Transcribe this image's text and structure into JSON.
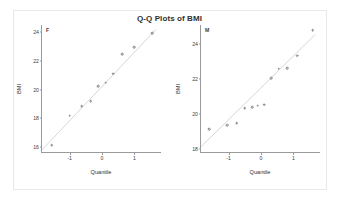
{
  "figure": {
    "title": "Q-Q Plots of BMI",
    "background": "#ffffff",
    "frame_color": "#e8e8e8",
    "axis_color": "#9a9a9a",
    "marker_color": "#7b7b7b",
    "refline_color": "#c4c4c4"
  },
  "chart_data": [
    {
      "type": "scatter",
      "title": "Q-Q Plots of BMI",
      "panel": "F",
      "xlabel": "Quantile",
      "ylabel": "BMI",
      "xlim": [
        -1.85,
        1.85
      ],
      "ylim": [
        15.6,
        24.5
      ],
      "xticks": [
        -1,
        0,
        1
      ],
      "xtick_labels": [
        "-1",
        "0",
        "1"
      ],
      "yticks": [
        16,
        18,
        20,
        22,
        24
      ],
      "ytick_labels": [
        "16",
        "18",
        "20",
        "22",
        "24"
      ],
      "grid": false,
      "legend": "none",
      "reference_line": {
        "x": [
          -1.85,
          1.7
        ],
        "y": [
          15.75,
          24.2
        ]
      },
      "x": [
        -1.55,
        -1.0,
        -0.62,
        -0.35,
        -0.12,
        0.12,
        0.35,
        0.62,
        1.0,
        1.55
      ],
      "y": [
        16.15,
        18.2,
        18.85,
        19.2,
        20.25,
        20.5,
        21.1,
        22.45,
        22.95,
        23.95
      ],
      "n_points": 10
    },
    {
      "type": "scatter",
      "title": "Q-Q Plots of BMI",
      "panel": "M",
      "xlabel": "Quantile",
      "ylabel": "BMI",
      "xlim": [
        -1.85,
        1.85
      ],
      "ylim": [
        17.8,
        25.1
      ],
      "xticks": [
        -1,
        0,
        1
      ],
      "xtick_labels": [
        "-1",
        "0",
        "1"
      ],
      "yticks": [
        18,
        20,
        22,
        24
      ],
      "ytick_labels": [
        "18",
        "20",
        "22",
        "24"
      ],
      "grid": false,
      "legend": "none",
      "reference_line": {
        "x": [
          -1.85,
          1.7
        ],
        "y": [
          18.1,
          24.55
        ]
      },
      "x": [
        -1.6,
        -1.05,
        -0.75,
        -0.5,
        -0.28,
        -0.1,
        0.1,
        0.32,
        0.55,
        0.8,
        1.12,
        1.6
      ],
      "y": [
        19.15,
        19.4,
        19.5,
        20.35,
        20.4,
        20.5,
        20.55,
        22.05,
        22.6,
        22.65,
        23.35,
        24.8
      ],
      "n_points": 12
    }
  ]
}
